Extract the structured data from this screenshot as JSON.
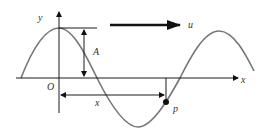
{
  "diagram": {
    "labels": {
      "y_axis": "y",
      "x_axis": "x",
      "origin": "O",
      "amplitude": "A",
      "distance": "x",
      "point": "p",
      "velocity": "u"
    },
    "colors": {
      "wave": "#777777",
      "axes": "#1a1a1a",
      "background": "#ffffff"
    }
  }
}
